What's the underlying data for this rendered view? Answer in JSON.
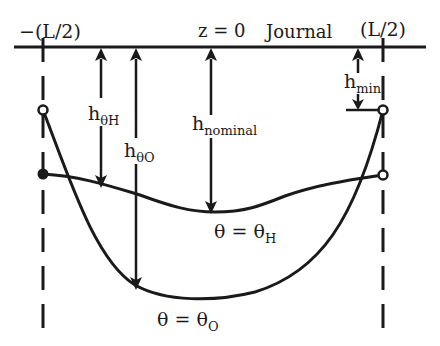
{
  "diagram": {
    "type": "journal bearing film thickness schematic",
    "top_labels": {
      "left_end": "−(L/2)",
      "center": "z = 0",
      "surface": "Journal",
      "right_end": "(L/2)"
    },
    "dimension_labels": {
      "h_theta_H": {
        "base": "h",
        "sub": "θH"
      },
      "h_theta_O": {
        "base": "h",
        "sub": "θO"
      },
      "h_nominal": {
        "base": "h",
        "sub": "nominal"
      },
      "h_min": {
        "base": "h",
        "sub": "min"
      }
    },
    "curve_labels": {
      "theta_H": {
        "main": "θ = θ",
        "sub": "H"
      },
      "theta_O": {
        "main": "θ = θ",
        "sub": "O"
      }
    },
    "colors": {
      "stroke": "#1a1a1a",
      "background": "#ffffff"
    }
  }
}
